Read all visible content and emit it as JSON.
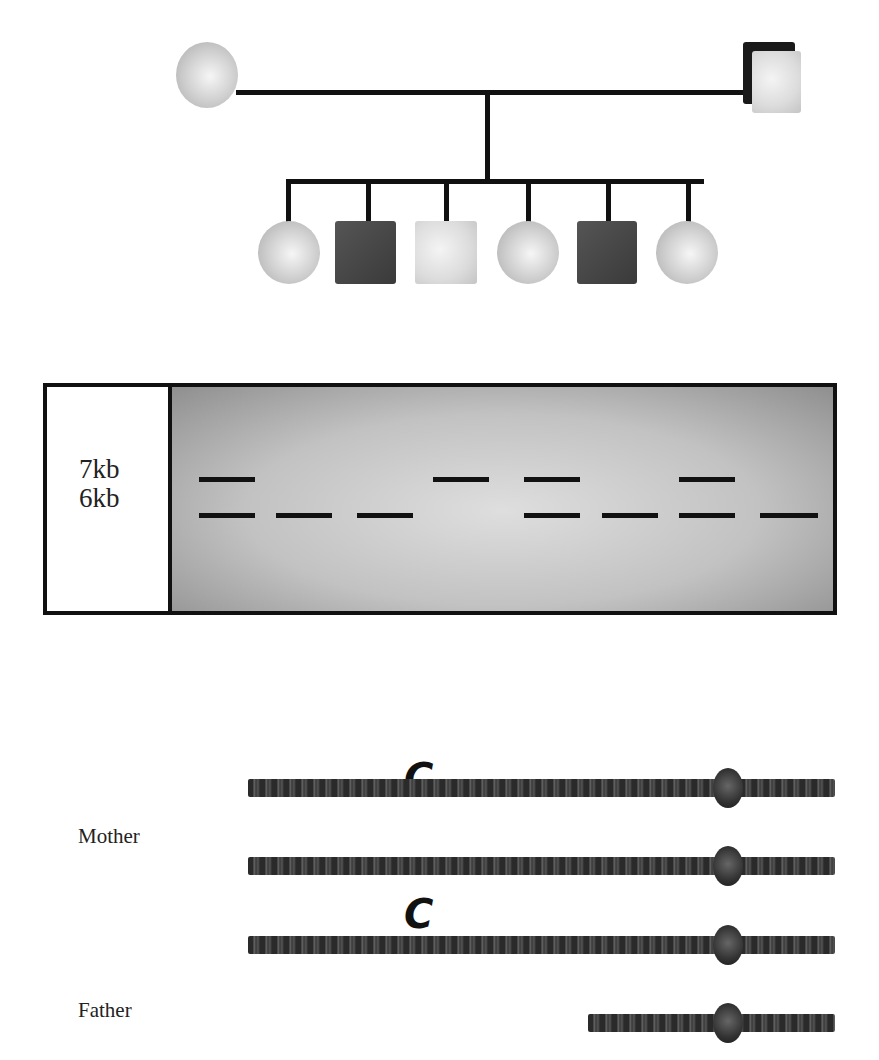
{
  "pedigree": {
    "parents": [
      {
        "role": "mother",
        "shape": "circle",
        "affected": false
      },
      {
        "role": "father",
        "shape": "square",
        "affected": false
      }
    ],
    "children": [
      {
        "shape": "circle",
        "affected": false
      },
      {
        "shape": "square",
        "affected": true
      },
      {
        "shape": "square",
        "affected": false
      },
      {
        "shape": "circle",
        "affected": false
      },
      {
        "shape": "square",
        "affected": true
      },
      {
        "shape": "circle",
        "affected": false
      }
    ],
    "colors": {
      "line": "#111111",
      "affected": "#3a3a3a",
      "unaffected": "#d8d8d8"
    }
  },
  "gel": {
    "markers": [
      "7kb",
      "6kb"
    ],
    "lanes": [
      {
        "lane": 1,
        "bands": [
          "7kb",
          "6kb"
        ]
      },
      {
        "lane": 2,
        "bands": [
          "6kb"
        ]
      },
      {
        "lane": 3,
        "bands": [
          "6kb"
        ]
      },
      {
        "lane": 4,
        "bands": [
          "7kb"
        ]
      },
      {
        "lane": 5,
        "bands": [
          "7kb",
          "6kb"
        ]
      },
      {
        "lane": 6,
        "bands": [
          "6kb"
        ]
      },
      {
        "lane": 7,
        "bands": [
          "7kb",
          "6kb"
        ]
      },
      {
        "lane": 8,
        "bands": [
          "6kb"
        ]
      }
    ]
  },
  "chromosomes": {
    "labels": {
      "mother": "Mother",
      "father": "Father"
    },
    "allele_marker": "C",
    "rows": [
      {
        "owner": "mother",
        "length": "long",
        "marker": "C"
      },
      {
        "owner": "mother",
        "length": "long",
        "marker": ""
      },
      {
        "owner": "father",
        "length": "long",
        "marker": "C"
      },
      {
        "owner": "father",
        "length": "short",
        "marker": ""
      }
    ]
  }
}
